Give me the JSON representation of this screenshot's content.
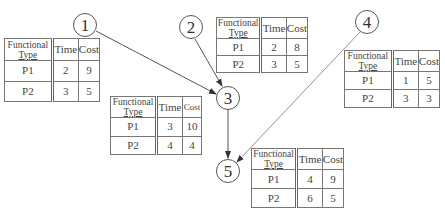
{
  "nodes": [
    {
      "id": "1",
      "label": "1"
    },
    {
      "id": "2",
      "label": "2"
    },
    {
      "id": "3",
      "label": "3"
    },
    {
      "id": "4",
      "label": "4"
    },
    {
      "id": "5",
      "label": "5"
    }
  ],
  "edges": [
    {
      "from": "1",
      "to": "3"
    },
    {
      "from": "2",
      "to": "3"
    },
    {
      "from": "3",
      "to": "5"
    },
    {
      "from": "4",
      "to": "5"
    }
  ],
  "table_headers": {
    "type_line1": "Functional",
    "type_line2": "Type",
    "time": "Time",
    "cost": "Cost"
  },
  "tables": {
    "t1": {
      "node": "1",
      "rows": [
        {
          "type": "P1",
          "time": "2",
          "cost": "9"
        },
        {
          "type": "P2",
          "time": "3",
          "cost": "5"
        }
      ]
    },
    "t2": {
      "node": "2",
      "rows": [
        {
          "type": "P1",
          "time": "2",
          "cost": "8"
        },
        {
          "type": "P2",
          "time": "3",
          "cost": "5"
        }
      ]
    },
    "t3": {
      "node": "3",
      "rows": [
        {
          "type": "P1",
          "time": "3",
          "cost": "10"
        },
        {
          "type": "P2",
          "time": "4",
          "cost": "4"
        }
      ]
    },
    "t4": {
      "node": "4",
      "rows": [
        {
          "type": "P1",
          "time": "1",
          "cost": "5"
        },
        {
          "type": "P2",
          "time": "3",
          "cost": "3"
        }
      ]
    },
    "t5": {
      "node": "5",
      "rows": [
        {
          "type": "P1",
          "time": "4",
          "cost": "9"
        },
        {
          "type": "P2",
          "time": "6",
          "cost": "5"
        }
      ]
    }
  }
}
